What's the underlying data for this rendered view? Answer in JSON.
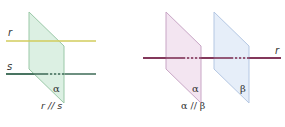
{
  "figure_left": {
    "caption": "r // s",
    "plane": {
      "label": "α",
      "fill": "#d9efe1",
      "stroke": "#9ac8a7",
      "points": "29,12 64,46 64,103 29,69"
    },
    "lines": [
      {
        "label": "r",
        "color": "#d2cc5c",
        "y": 41,
        "x_start": 6,
        "x_end": 96,
        "hidden_segment": null
      },
      {
        "label": "s",
        "color": "#3e6b57",
        "y": 74,
        "x_start": 6,
        "x_end": 96,
        "hidden_segment": [
          46,
          64
        ]
      }
    ]
  },
  "figure_right": {
    "caption": "α // β",
    "planes": [
      {
        "label": "α",
        "fill": "#f2e3f0",
        "stroke": "#c8a5c5",
        "points": "166,12 201,46 201,103 166,69"
      },
      {
        "label": "β",
        "fill": "#e4edf9",
        "stroke": "#b4c7e3",
        "points": "214,12 249,46 249,103 214,69"
      }
    ],
    "line": {
      "label": "r",
      "color": "#7b2b50",
      "y": 58,
      "x_start": 143,
      "x_end": 281,
      "hidden_segments": [
        [
          183,
          201
        ],
        [
          231,
          249
        ]
      ]
    }
  }
}
